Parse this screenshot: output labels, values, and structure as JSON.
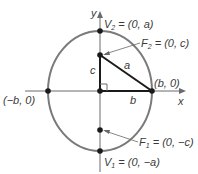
{
  "diagram": {
    "colors": {
      "ellipse": "#7a7a7a",
      "axes": "#6a6a6a",
      "triangle": "#1a1a1a",
      "points": "#1a1a1a",
      "text": "#3a3a3a",
      "background": "#ffffff"
    },
    "axes": {
      "x_label": "x",
      "y_label": "y"
    },
    "points": {
      "V2": {
        "name": "V",
        "sub": "2",
        "rest": " = (0, a)"
      },
      "F2": {
        "name": "F",
        "sub": "2",
        "rest": " = (0, c)"
      },
      "F1": {
        "name": "F",
        "sub": "1",
        "rest": " = (0, −c)"
      },
      "V1": {
        "name": "V",
        "sub": "1",
        "rest": " = (0, −a)"
      },
      "b_pos": "(b, 0)",
      "b_neg": "(−b, 0)"
    },
    "triangle": {
      "side_c": "c",
      "side_a": "a",
      "side_b": "b"
    }
  }
}
